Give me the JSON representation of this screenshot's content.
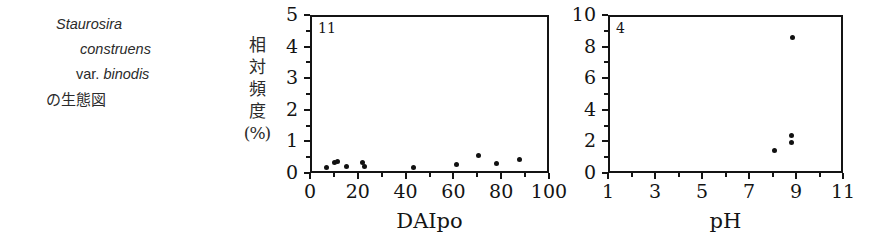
{
  "caption": {
    "line1": "Staurosira",
    "line2": "construens",
    "line3_prefix": "var. ",
    "line3_epithet": "binodis",
    "line4": "の生態図"
  },
  "yaxis_label": {
    "chars": [
      "相",
      "対",
      "頻",
      "度"
    ],
    "unit": "(%)"
  },
  "chart_data": [
    {
      "type": "scatter",
      "title": "",
      "xlabel": "DAIpo",
      "ylabel": "相対頻度(%)",
      "sample_count": "11",
      "xlim": [
        0,
        100
      ],
      "ylim": [
        0,
        5
      ],
      "xticks": [
        0,
        20,
        40,
        60,
        80,
        100
      ],
      "xtick_labels": [
        "0",
        "20",
        "40",
        "60",
        "80",
        "100"
      ],
      "xminor": [
        10,
        30,
        50,
        70,
        90
      ],
      "yticks": [
        0,
        1,
        2,
        3,
        4,
        5
      ],
      "ytick_labels": [
        "0",
        "1",
        "2",
        "3",
        "4",
        "5"
      ],
      "yminor": [
        0.5,
        1.5,
        2.5,
        3.5,
        4.5
      ],
      "grid": false,
      "legend": "none",
      "points": [
        {
          "x": 7.0,
          "y": 0.17
        },
        {
          "x": 10.2,
          "y": 0.33
        },
        {
          "x": 11.6,
          "y": 0.37
        },
        {
          "x": 15.2,
          "y": 0.19
        },
        {
          "x": 22.0,
          "y": 0.33
        },
        {
          "x": 23.0,
          "y": 0.22
        },
        {
          "x": 43.5,
          "y": 0.16
        },
        {
          "x": 61.5,
          "y": 0.26
        },
        {
          "x": 70.5,
          "y": 0.55
        },
        {
          "x": 78.0,
          "y": 0.31
        },
        {
          "x": 87.5,
          "y": 0.44
        }
      ]
    },
    {
      "type": "scatter",
      "title": "",
      "xlabel": "pH",
      "ylabel": "相対頻度(%)",
      "sample_count": "4",
      "xlim": [
        1,
        11
      ],
      "ylim": [
        0,
        10
      ],
      "xticks": [
        1,
        3,
        5,
        7,
        9,
        11
      ],
      "xtick_labels": [
        "1",
        "3",
        "5",
        "7",
        "9",
        "11"
      ],
      "xminor": [
        2,
        4,
        6,
        8,
        10
      ],
      "yticks": [
        0,
        2,
        4,
        6,
        8,
        10
      ],
      "ytick_labels": [
        "0",
        "2",
        "4",
        "6",
        "8",
        "10"
      ],
      "yminor": [
        1,
        3,
        5,
        7,
        9
      ],
      "grid": false,
      "legend": "none",
      "points": [
        {
          "x": 8.1,
          "y": 1.4
        },
        {
          "x": 8.8,
          "y": 1.95
        },
        {
          "x": 8.8,
          "y": 2.35
        },
        {
          "x": 8.85,
          "y": 8.6
        }
      ]
    }
  ],
  "colors": {
    "axis": "#141414",
    "point": "#111111",
    "text": "#2b2b2b",
    "background": "#ffffff"
  }
}
